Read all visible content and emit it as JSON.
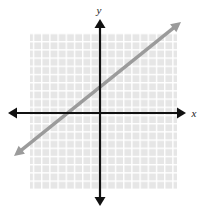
{
  "figure": {
    "width": 199,
    "height": 215,
    "background_color": "#ffffff"
  },
  "axes": {
    "x_label": "x",
    "y_label": "y",
    "axis_color": "#111111",
    "origin_px": {
      "x": 100,
      "y": 113
    },
    "x_axis_extent_px": {
      "start": 8,
      "end": 186
    },
    "y_axis_extent_px": {
      "start": 19,
      "end": 206
    },
    "arrowheads": "both-ends"
  },
  "grid": {
    "cell_color": "#e6e6e6",
    "line_color": "#ffffff",
    "spacing_px": 8.2,
    "left_px": 30,
    "top_px": 33,
    "right_px": 177,
    "bottom_px": 189,
    "columns": 18,
    "rows": 19,
    "visible": true
  },
  "chart_data": {
    "type": "line",
    "title": "",
    "xlabel": "x",
    "ylabel": "y",
    "grid": true,
    "legend": null,
    "xlim": [
      -8.5,
      9.4
    ],
    "ylim": [
      -9.3,
      9.8
    ],
    "series": [
      {
        "name": "line",
        "color": "#9b9b9b",
        "slope": 0.8,
        "intercept": 3,
        "equation": "y = 0.8x + 3",
        "x_intercept": -3.75,
        "y_intercept": 3,
        "arrowheads": "both-ends",
        "x": [
          -8.5,
          9.4
        ],
        "y": [
          -3.8,
          10.5
        ],
        "points_px": [
          {
            "x": 14,
            "y": 156
          },
          {
            "x": 181,
            "y": 22
          }
        ]
      }
    ]
  }
}
